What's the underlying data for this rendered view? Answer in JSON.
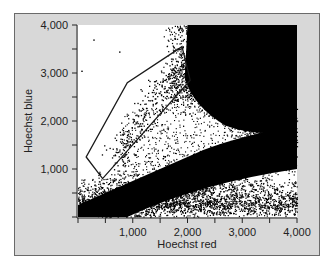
{
  "chart_data": {
    "type": "scatter",
    "title": "",
    "xlabel": "Hoechst red",
    "ylabel": "Hoechst blue",
    "xlim": [
      0,
      4000
    ],
    "ylim": [
      0,
      4000
    ],
    "x_ticks": [
      1000,
      2000,
      3000,
      4000
    ],
    "x_tick_labels": [
      "1,000",
      "2,000",
      "3,000",
      "4,000"
    ],
    "y_ticks": [
      1000,
      2000,
      3000,
      4000
    ],
    "y_tick_labels": [
      "1,000",
      "2,000",
      "3,000",
      "4,000"
    ],
    "minor_ticks_every": 500,
    "grid": false,
    "legend": null,
    "gate_polygon": {
      "label": "side population gate",
      "vertices": [
        [
          150,
          1250
        ],
        [
          450,
          800
        ],
        [
          2050,
          2850
        ],
        [
          1900,
          3550
        ],
        [
          900,
          2800
        ]
      ]
    },
    "clusters": [
      {
        "name": "main population (dense, upper right)",
        "x_range": [
          1900,
          4000
        ],
        "y_range": [
          1700,
          4000
        ],
        "density": "very high"
      },
      {
        "name": "diagonal band",
        "from": [
          300,
          0
        ],
        "to": [
          4000,
          2000
        ],
        "density": "high"
      },
      {
        "name": "side population (in gate)",
        "from": [
          600,
          1100
        ],
        "to": [
          1800,
          3200
        ],
        "density": "sparse"
      },
      {
        "name": "low-intensity events (bottom)",
        "x_range": [
          0,
          4000
        ],
        "y_range": [
          0,
          600
        ],
        "density": "medium"
      }
    ],
    "colors": {
      "points": "#000000",
      "plot_bg": "#ffffff",
      "frame_bg": "#d8d8d8",
      "gate": "#1a1a1a"
    }
  }
}
